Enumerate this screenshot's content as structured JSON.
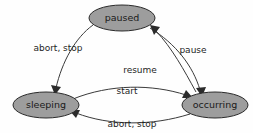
{
  "diagram": {
    "type": "state-machine-diagram",
    "background_color": "#fefefe",
    "node_fill_color": "#9d9d9d",
    "node_stroke_color": "#2b2b2b",
    "edge_color": "#3a3a3a",
    "label_color": "#1f1f1f",
    "states": [
      {
        "id": "paused",
        "label": "paused",
        "cx": 122,
        "cy": 18,
        "rx": 33,
        "ry": 13
      },
      {
        "id": "sleeping",
        "label": "sleeping",
        "cx": 46,
        "cy": 105,
        "rx": 33,
        "ry": 13
      },
      {
        "id": "occurring",
        "label": "occurring",
        "cx": 215,
        "cy": 105,
        "rx": 33,
        "ry": 13
      }
    ],
    "transitions": [
      {
        "id": "paused-to-sleeping",
        "from": "paused",
        "to": "sleeping",
        "label": "abort, stop",
        "label_x": 58,
        "label_y": 48
      },
      {
        "id": "paused-to-occurring",
        "from": "paused",
        "to": "occurring",
        "label": "pause",
        "label_x": 193,
        "label_y": 50
      },
      {
        "id": "occurring-to-paused",
        "from": "occurring",
        "to": "paused",
        "label": "resume",
        "label_x": 140,
        "label_y": 70
      },
      {
        "id": "sleeping-to-occurring",
        "from": "sleeping",
        "to": "occurring",
        "label": "start",
        "label_x": 127,
        "label_y": 91
      },
      {
        "id": "occurring-to-sleeping",
        "from": "occurring",
        "to": "sleeping",
        "label": "abort, stop",
        "label_x": 132,
        "label_y": 124
      }
    ]
  }
}
